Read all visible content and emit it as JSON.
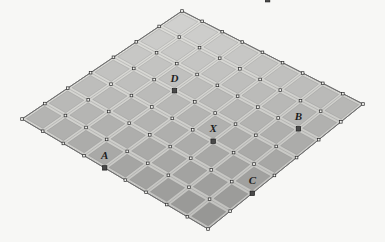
{
  "figure": {
    "type": "geometry-diagram",
    "background_color": "#f7f7f5"
  },
  "grid": {
    "description": "Perspective (isometric) square grid drawn as a rhombus, subdivided into tiles",
    "columns": 9,
    "rows": 7,
    "tile_count": 63,
    "corners": {
      "top": {
        "x": 182,
        "y": 11
      },
      "right": {
        "x": 363,
        "y": 104
      },
      "bottom": {
        "x": 208,
        "y": 229
      },
      "left": {
        "x": 22,
        "y": 119
      }
    },
    "colors": {
      "tile_fill_light": "#cfcfcb",
      "tile_fill_dark": "#9a9a98",
      "grout": "#e3e3df",
      "grid_line": "#8c8c8c",
      "outline": "#7a7a7a",
      "node_fill": "#f2f2ef",
      "node_stroke": "#2b2b2b",
      "marker_fill": "#4a4a4a",
      "marker_stroke": "#1d1d1d",
      "label_color": "#1d1d1d"
    },
    "node_marker_shape": "small-square",
    "labeled_marker_shape": "filled-square"
  },
  "points": [
    {
      "id": "A",
      "label": "A",
      "col": 4,
      "row": 0,
      "x": 107,
      "y": 62,
      "label_x": 107,
      "label_y": 48
    },
    {
      "id": "C",
      "label": "C",
      "col": 9,
      "row": 2,
      "x": 224,
      "y": 33,
      "label_x": 222,
      "label_y": 17
    },
    {
      "id": "X",
      "label": "X",
      "col": 6,
      "row": 3,
      "x": 214,
      "y": 95,
      "label_x": 213,
      "label_y": 83
    },
    {
      "id": "B",
      "label": "B",
      "col": 8,
      "row": 5,
      "x": 261,
      "y": 121,
      "label_x": 260,
      "label_y": 109
    },
    {
      "id": "D",
      "label": "D",
      "col": 3,
      "row": 4,
      "x": 130,
      "y": 126,
      "label_x": 129,
      "label_y": 114
    },
    {
      "id": "E",
      "label": "E",
      "col": 2,
      "row": 9,
      "x": 208,
      "y": 229,
      "label_x": 207,
      "label_y": 215
    }
  ],
  "labels": {
    "A": "A",
    "B": "B",
    "C": "C",
    "D": "D",
    "E": "E",
    "X": "X"
  }
}
